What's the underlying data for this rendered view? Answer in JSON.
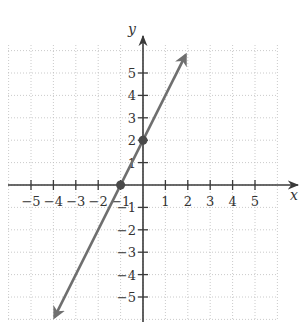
{
  "chart_data": {
    "type": "line",
    "title": "",
    "xlabel": "x",
    "ylabel": "y",
    "xlim": [
      -6,
      6
    ],
    "ylim": [
      -6,
      6
    ],
    "grid": true,
    "x_ticks": [
      -5,
      -4,
      -3,
      -2,
      -1,
      1,
      2,
      3,
      4,
      5
    ],
    "y_ticks": [
      -5,
      -4,
      -3,
      -2,
      -1,
      1,
      2,
      3,
      4,
      5
    ],
    "x_tick_labels": [
      "−5",
      "−4",
      "−3",
      "−2",
      "−1",
      "1",
      "2",
      "3",
      "4",
      "5"
    ],
    "y_tick_labels": [
      "−5",
      "−4",
      "−3",
      "−2",
      "−1",
      "1",
      "2",
      "3",
      "4",
      "5"
    ],
    "series": [
      {
        "name": "y = 2x + 2",
        "slope": 2,
        "intercept": 2,
        "x_range": [
          -3.95,
          1.9
        ],
        "arrows": "both",
        "color": "#6f6f6f"
      }
    ],
    "points": [
      {
        "x": -1,
        "y": 0,
        "label": "x-intercept"
      },
      {
        "x": 0,
        "y": 2,
        "label": "y-intercept"
      }
    ]
  }
}
